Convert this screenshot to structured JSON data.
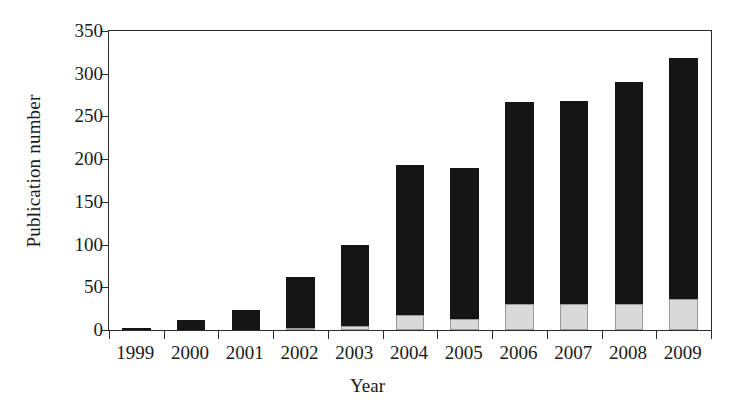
{
  "chart_data": {
    "type": "bar",
    "stacked": true,
    "title": "",
    "xlabel": "Year",
    "ylabel": "Publication number",
    "categories": [
      "1999",
      "2000",
      "2001",
      "2002",
      "2003",
      "2004",
      "2005",
      "2006",
      "2007",
      "2008",
      "2009"
    ],
    "series": [
      {
        "name": "lower-segment",
        "color": "#d9d9d9",
        "values": [
          0,
          0,
          0,
          2,
          5,
          17,
          13,
          30,
          30,
          30,
          36
        ]
      },
      {
        "name": "upper-segment",
        "color": "#151515",
        "values": [
          2,
          12,
          24,
          60,
          94,
          176,
          177,
          237,
          238,
          260,
          282
        ]
      }
    ],
    "totals": [
      2,
      12,
      24,
      62,
      99,
      193,
      190,
      267,
      268,
      290,
      318
    ],
    "ylim": [
      0,
      350
    ],
    "yticks": [
      0,
      50,
      100,
      150,
      200,
      250,
      300,
      350
    ],
    "ytick_labels": [
      "0",
      "50",
      "100",
      "150",
      "200",
      "250",
      "300",
      "350"
    ],
    "grid": false,
    "legend": "none",
    "frame": "box"
  },
  "axes": {
    "y_title": "Publication number",
    "x_title": "Year"
  }
}
